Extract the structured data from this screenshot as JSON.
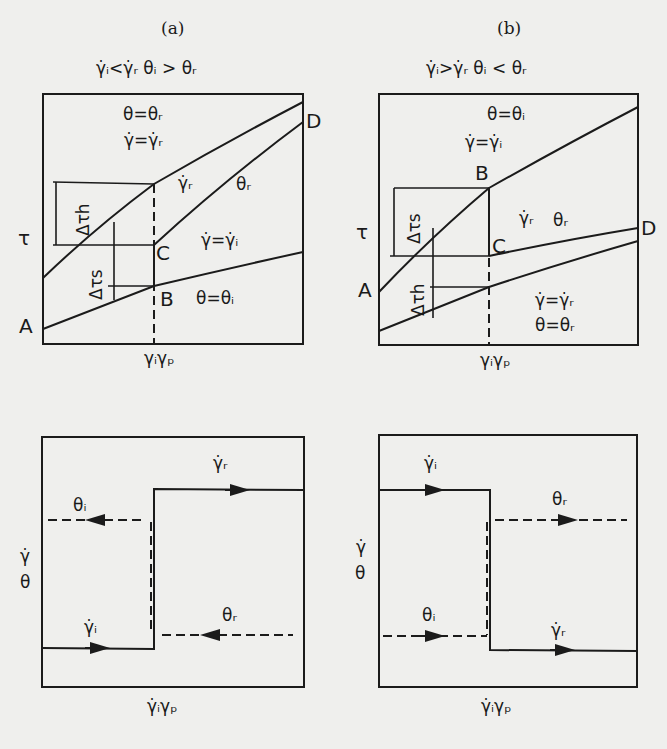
{
  "figure": {
    "panel_a": {
      "tag": "(a)",
      "condition": "γ̇ᵢ<γ̇ᵣ  θᵢ > θᵣ",
      "top_chart": {
        "y_axis_label": "τ",
        "x_marker_label": "γᵢγₚ",
        "region_upper": [
          "θ=θᵣ",
          "γ̇=γ̇ᵣ"
        ],
        "curve_labels": [
          "γ̇ᵣ",
          "θᵣ"
        ],
        "region_mid": "γ̇=γ̇ᵢ",
        "region_lower": "θ=θᵢ",
        "points": [
          "A",
          "B",
          "C",
          "D"
        ],
        "deltas": [
          "Δτh",
          "Δτs"
        ]
      },
      "bottom_chart": {
        "y_axis_labels": [
          "γ̇",
          "θ"
        ],
        "x_marker_label": "γ̇ᵢγₚ",
        "step_labels": [
          "θᵢ",
          "γ̇ᵣ",
          "θᵣ",
          "γ̇ᵢ"
        ]
      }
    },
    "panel_b": {
      "tag": "(b)",
      "condition": "γ̇ᵢ>γ̇ᵣ   θᵢ < θᵣ",
      "top_chart": {
        "y_axis_label": "τ",
        "x_marker_label": "γᵢγₚ",
        "region_upper": [
          "θ=θᵢ",
          "γ̇=γ̇ᵢ"
        ],
        "curve_labels": [
          "γ̇ᵣ",
          "θᵣ"
        ],
        "region_lower": [
          "γ̇=γ̇ᵣ",
          "θ=θᵣ"
        ],
        "points": [
          "A",
          "B",
          "C",
          "D"
        ],
        "deltas": [
          "Δτs",
          "Δτh"
        ]
      },
      "bottom_chart": {
        "y_axis_labels": [
          "γ̇",
          "θ"
        ],
        "x_marker_label": "γ̇ᵢγₚ",
        "step_labels": [
          "γ̇ᵢ",
          "θᵣ",
          "θᵢ",
          "γ̇ᵣ"
        ]
      }
    }
  }
}
